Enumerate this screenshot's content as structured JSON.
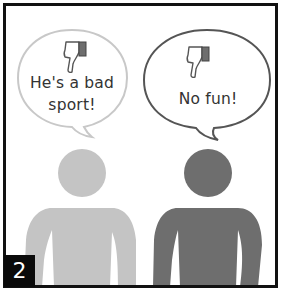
{
  "panel": {
    "number": "2",
    "border_color": "#111111",
    "background": "#ffffff"
  },
  "bubbles": [
    {
      "speaker": "left-person",
      "icon": "thumbs-down-icon",
      "text_line1": "He's a bad",
      "text_line2": "sport!",
      "outline_color": "#c8c8c8"
    },
    {
      "speaker": "right-person",
      "icon": "thumbs-down-icon",
      "text_line1": "No fun!",
      "outline_color": "#555555"
    }
  ],
  "people": [
    {
      "name": "left-person",
      "color": "#c4c4c4"
    },
    {
      "name": "right-person",
      "color": "#6e6e6e"
    }
  ]
}
